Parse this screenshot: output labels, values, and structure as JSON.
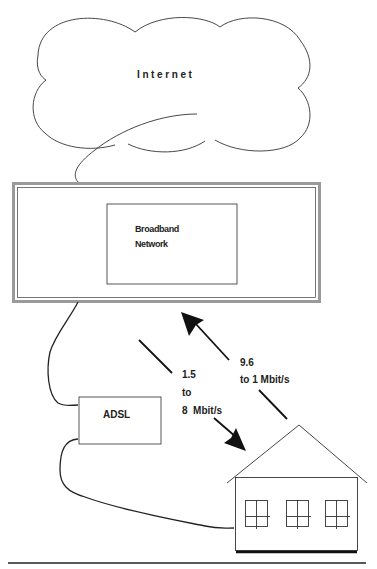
{
  "diagram": {
    "cloud": {
      "label": "Internet"
    },
    "network": {
      "line1": "Broadband",
      "line2": "Network"
    },
    "modem": {
      "label": "ADSL"
    },
    "downstream": {
      "line1": "1.5",
      "line2": "to",
      "line3": "8  Mbit/s"
    },
    "upstream": {
      "line1": "9.6",
      "line2": "to 1 Mbit/s"
    },
    "colors": {
      "stroke": "#222222",
      "frame": "#9a9a9a"
    }
  }
}
